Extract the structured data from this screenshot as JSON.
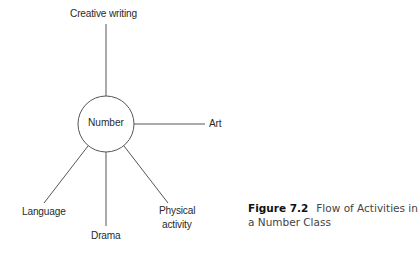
{
  "diagram": {
    "center": {
      "label": "Number"
    },
    "nodes": [
      {
        "id": "creative-writing",
        "label": "Creative writing"
      },
      {
        "id": "art",
        "label": "Art"
      },
      {
        "id": "language",
        "label": "Language"
      },
      {
        "id": "drama",
        "label": "Drama"
      },
      {
        "id": "physical-activity",
        "label_line1": "Physical",
        "label_line2": "activity"
      }
    ],
    "edge_color": "#555555"
  },
  "caption": {
    "figure_number": "Figure 7.2",
    "text_line1": "Flow of Activities in",
    "text_line2": "a Number Class"
  }
}
